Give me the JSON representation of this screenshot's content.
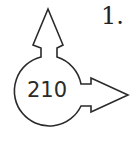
{
  "diagram": {
    "item_number": "1.",
    "center_value": "210",
    "shapes": {
      "circle": {
        "cx": 47,
        "cy": 95,
        "r": 35
      },
      "arrow_up": {
        "direction": "up"
      },
      "arrow_right": {
        "direction": "right"
      }
    },
    "stroke_color": "#2a2a2a"
  }
}
